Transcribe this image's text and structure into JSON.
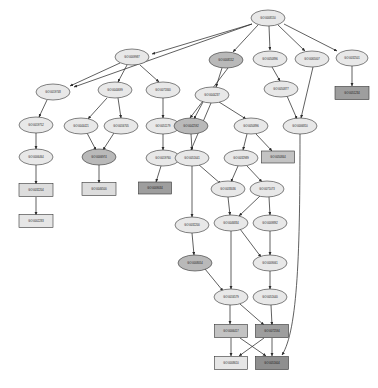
{
  "figure": {
    "type": "gene-ontology-dag",
    "title": "",
    "background": "#ffffff",
    "edge_color": "#2b2b2b",
    "node_border_color": "#333333"
  },
  "fills": {
    "ellipse_light": "#e8e8e8",
    "ellipse_mid": "#d2d2d2",
    "ellipse_dark": "#b9b9b9",
    "box_light": "#dddddd",
    "box_pale": "#e6e6e6",
    "box_mid": "#c3c3c3",
    "box_dark": "#9e9e9e",
    "box_darker": "#8f8f8f"
  },
  "nodes": [
    {
      "id": "n0",
      "label": "GO:0008150",
      "shape": "ellipse",
      "fill": "ellipse_light",
      "x": 268,
      "y": 18,
      "rx": 17,
      "ry": 8
    },
    {
      "id": "n1",
      "label": "GO:0009987",
      "shape": "ellipse",
      "fill": "ellipse_light",
      "x": 132,
      "y": 57,
      "rx": 17,
      "ry": 8
    },
    {
      "id": "n2",
      "label": "GO:0008152",
      "shape": "ellipse",
      "fill": "ellipse_dark",
      "x": 226,
      "y": 60,
      "rx": 17,
      "ry": 8
    },
    {
      "id": "n3",
      "label": "GO:0050896",
      "shape": "ellipse",
      "fill": "ellipse_light",
      "x": 270,
      "y": 59,
      "rx": 17,
      "ry": 8
    },
    {
      "id": "n4",
      "label": "GO:0065007",
      "shape": "ellipse",
      "fill": "ellipse_light",
      "x": 312,
      "y": 59,
      "rx": 17,
      "ry": 8
    },
    {
      "id": "n5",
      "label": "GO:0032501",
      "shape": "ellipse",
      "fill": "ellipse_light",
      "x": 352,
      "y": 58,
      "rx": 16,
      "ry": 8
    },
    {
      "id": "n6",
      "label": "GO:0019748",
      "shape": "ellipse",
      "fill": "ellipse_light",
      "x": 53,
      "y": 92,
      "rx": 17,
      "ry": 8
    },
    {
      "id": "n7",
      "label": "GO:0044699",
      "shape": "ellipse",
      "fill": "ellipse_light",
      "x": 115,
      "y": 90,
      "rx": 17,
      "ry": 8
    },
    {
      "id": "n8",
      "label": "GO:0071840",
      "shape": "ellipse",
      "fill": "ellipse_light",
      "x": 163,
      "y": 90,
      "rx": 17,
      "ry": 8
    },
    {
      "id": "n9",
      "label": "GO:0044237",
      "shape": "ellipse",
      "fill": "ellipse_light",
      "x": 212,
      "y": 95,
      "rx": 17,
      "ry": 8
    },
    {
      "id": "n10",
      "label": "GO:0050877",
      "shape": "ellipse",
      "fill": "ellipse_light",
      "x": 281,
      "y": 89,
      "rx": 17,
      "ry": 8
    },
    {
      "id": "n11",
      "label": "GO:0051234",
      "shape": "box",
      "fill": "box_dark",
      "x": 352,
      "y": 93,
      "w": 34,
      "h": 13
    },
    {
      "id": "n12",
      "label": "GO:0019752",
      "shape": "ellipse",
      "fill": "ellipse_light",
      "x": 36,
      "y": 125,
      "rx": 17,
      "ry": 8
    },
    {
      "id": "n13",
      "label": "GO:0044421",
      "shape": "ellipse",
      "fill": "ellipse_light",
      "x": 81,
      "y": 126,
      "rx": 17,
      "ry": 8
    },
    {
      "id": "n14",
      "label": "GO:0016705",
      "shape": "ellipse",
      "fill": "ellipse_light",
      "x": 121,
      "y": 126,
      "rx": 17,
      "ry": 8
    },
    {
      "id": "n15",
      "label": "GO:0051179",
      "shape": "ellipse",
      "fill": "ellipse_light",
      "x": 163,
      "y": 126,
      "rx": 17,
      "ry": 8
    },
    {
      "id": "n16",
      "label": "GO:0042592",
      "shape": "ellipse",
      "fill": "ellipse_dark",
      "x": 191,
      "y": 126,
      "rx": 17,
      "ry": 8
    },
    {
      "id": "n17",
      "label": "GO:0050896",
      "shape": "ellipse",
      "fill": "ellipse_light",
      "x": 251,
      "y": 126,
      "rx": 17,
      "ry": 8
    },
    {
      "id": "n18",
      "label": "GO:0006810",
      "shape": "ellipse",
      "fill": "ellipse_light",
      "x": 300,
      "y": 126,
      "rx": 17,
      "ry": 8
    },
    {
      "id": "n19",
      "label": "GO:0006464",
      "shape": "ellipse",
      "fill": "ellipse_light",
      "x": 36,
      "y": 157,
      "rx": 17,
      "ry": 8
    },
    {
      "id": "n20",
      "label": "GO:0006974",
      "shape": "ellipse",
      "fill": "ellipse_dark",
      "x": 99,
      "y": 157,
      "rx": 17,
      "ry": 8
    },
    {
      "id": "n21",
      "label": "GO:0019760",
      "shape": "ellipse",
      "fill": "ellipse_light",
      "x": 163,
      "y": 158,
      "rx": 17,
      "ry": 8
    },
    {
      "id": "n22",
      "label": "GO:0051641",
      "shape": "ellipse",
      "fill": "ellipse_light",
      "x": 192,
      "y": 158,
      "rx": 17,
      "ry": 8
    },
    {
      "id": "n23",
      "label": "GO:0032989",
      "shape": "ellipse",
      "fill": "ellipse_light",
      "x": 241,
      "y": 158,
      "rx": 17,
      "ry": 8
    },
    {
      "id": "n24",
      "label": "GO:0050844",
      "shape": "box",
      "fill": "box_mid",
      "x": 278,
      "y": 157,
      "w": 33,
      "h": 12
    },
    {
      "id": "n25",
      "label": "GO:0032204",
      "shape": "box",
      "fill": "box_light",
      "x": 36,
      "y": 190,
      "w": 34,
      "h": 13
    },
    {
      "id": "n26",
      "label": "GO:0046500",
      "shape": "box",
      "fill": "box_light",
      "x": 99,
      "y": 189,
      "w": 34,
      "h": 13
    },
    {
      "id": "n27",
      "label": "GO:0009034",
      "shape": "box",
      "fill": "box_dark",
      "x": 155,
      "y": 188,
      "w": 33,
      "h": 12
    },
    {
      "id": "n28",
      "label": "GO:0033036",
      "shape": "ellipse",
      "fill": "ellipse_light",
      "x": 228,
      "y": 189,
      "rx": 17,
      "ry": 8
    },
    {
      "id": "n29",
      "label": "GO:0071073",
      "shape": "ellipse",
      "fill": "ellipse_light",
      "x": 267,
      "y": 189,
      "rx": 17,
      "ry": 8
    },
    {
      "id": "n30",
      "label": "GO:0002283",
      "shape": "box",
      "fill": "box_pale",
      "x": 36,
      "y": 221,
      "w": 34,
      "h": 13
    },
    {
      "id": "n31",
      "label": "GO:0032200",
      "shape": "ellipse",
      "fill": "ellipse_light",
      "x": 192,
      "y": 225,
      "rx": 17,
      "ry": 8
    },
    {
      "id": "n32",
      "label": "GO:0046834",
      "shape": "ellipse",
      "fill": "ellipse_light",
      "x": 231,
      "y": 223,
      "rx": 17,
      "ry": 8
    },
    {
      "id": "n33",
      "label": "GO:0009892",
      "shape": "ellipse",
      "fill": "ellipse_light",
      "x": 270,
      "y": 223,
      "rx": 17,
      "ry": 8
    },
    {
      "id": "n34",
      "label": "GO:0008054",
      "shape": "ellipse",
      "fill": "ellipse_dark",
      "x": 195,
      "y": 263,
      "rx": 17,
      "ry": 8
    },
    {
      "id": "n35",
      "label": "GO:0009061",
      "shape": "ellipse",
      "fill": "ellipse_light",
      "x": 270,
      "y": 263,
      "rx": 17,
      "ry": 8
    },
    {
      "id": "n36",
      "label": "GO:0016579",
      "shape": "ellipse",
      "fill": "ellipse_light",
      "x": 231,
      "y": 297,
      "rx": 17,
      "ry": 8
    },
    {
      "id": "n37",
      "label": "GO:0051640",
      "shape": "ellipse",
      "fill": "ellipse_light",
      "x": 270,
      "y": 297,
      "rx": 17,
      "ry": 8
    },
    {
      "id": "n38",
      "label": "GO:0006417",
      "shape": "box",
      "fill": "box_mid",
      "x": 231,
      "y": 331,
      "w": 33,
      "h": 13
    },
    {
      "id": "n39",
      "label": "GO:0072594",
      "shape": "box",
      "fill": "box_dark",
      "x": 272,
      "y": 331,
      "w": 33,
      "h": 13
    },
    {
      "id": "n40",
      "label": "GO:0008610",
      "shape": "box",
      "fill": "box_pale",
      "x": 231,
      "y": 363,
      "w": 33,
      "h": 13
    },
    {
      "id": "n41",
      "label": "GO:0051604",
      "shape": "box",
      "fill": "box_darker",
      "x": 272,
      "y": 363,
      "w": 33,
      "h": 13
    }
  ],
  "edges": [
    {
      "from": "n0",
      "to": "n1",
      "path": "M 252 24 L 152 54"
    },
    {
      "from": "n0",
      "to": "n6",
      "path": "M 252 24 L 74 87"
    },
    {
      "from": "n0",
      "to": "n2",
      "path": "M 258 25 L 233 52"
    },
    {
      "from": "n0",
      "to": "n3",
      "path": "M 269 26 L 270 50"
    },
    {
      "from": "n0",
      "to": "n4",
      "path": "M 278 25 L 305 51"
    },
    {
      "from": "n0",
      "to": "n5",
      "path": "M 284 24 L 337 51"
    },
    {
      "from": "n1",
      "to": "n6",
      "path": "M 120 63 L 70 86"
    },
    {
      "from": "n1",
      "to": "n7",
      "path": "M 127 65 L 118 82"
    },
    {
      "from": "n1",
      "to": "n8",
      "path": "M 140 65 L 159 82"
    },
    {
      "from": "n2",
      "to": "n9",
      "path": "M 222 68 L 216 87"
    },
    {
      "from": "n2",
      "to": "n16",
      "path": "M 228 68 L 190 118"
    },
    {
      "from": "n3",
      "to": "n10",
      "path": "M 272 67 L 280 81"
    },
    {
      "from": "n4",
      "to": "n18",
      "path": "M 313 67 L 301 118"
    },
    {
      "from": "n5",
      "to": "n11",
      "path": "M 352 66 L 352 86"
    },
    {
      "from": "n6",
      "to": "n12",
      "path": "M 47 100 L 39 117"
    },
    {
      "from": "n7",
      "to": "n13",
      "path": "M 107 98 L 88 119"
    },
    {
      "from": "n7",
      "to": "n14",
      "path": "M 118 98 L 121 118"
    },
    {
      "from": "n8",
      "to": "n15",
      "path": "M 163 98 L 163 118"
    },
    {
      "from": "n9",
      "to": "n16",
      "path": "M 203 102 L 194 119"
    },
    {
      "from": "n9",
      "to": "n17",
      "path": "M 219 102 L 246 119"
    },
    {
      "from": "n9",
      "to": "n22",
      "path": "M 211 103 L 191 150"
    },
    {
      "from": "n10",
      "to": "n18",
      "path": "M 287 96 L 297 119"
    },
    {
      "from": "n12",
      "to": "n19",
      "path": "M 36 133 L 36 149"
    },
    {
      "from": "n13",
      "to": "n20",
      "path": "M 87 133 L 96 150"
    },
    {
      "from": "n14",
      "to": "n20",
      "path": "M 114 133 L 103 150"
    },
    {
      "from": "n15",
      "to": "n21",
      "path": "M 163 134 L 163 150"
    },
    {
      "from": "n16",
      "to": "n22",
      "path": "M 191 134 L 192 150"
    },
    {
      "from": "n17",
      "to": "n23",
      "path": "M 247 134 L 243 150"
    },
    {
      "from": "n17",
      "to": "n24",
      "path": "M 256 134 L 272 151"
    },
    {
      "from": "n19",
      "to": "n25",
      "path": "M 36 165 L 36 184"
    },
    {
      "from": "n20",
      "to": "n26",
      "path": "M 99 165 L 99 183"
    },
    {
      "from": "n21",
      "to": "n27",
      "path": "M 161 166 L 156 182"
    },
    {
      "from": "n22",
      "to": "n28",
      "path": "M 198 164 L 221 184"
    },
    {
      "from": "n22",
      "to": "n31",
      "path": "M 192 166 L 192 217"
    },
    {
      "from": "n23",
      "to": "n28",
      "path": "M 238 166 L 231 182"
    },
    {
      "from": "n23",
      "to": "n29",
      "path": "M 247 166 L 262 182"
    },
    {
      "from": "n25",
      "to": "n30",
      "path": "M 36 197 L 36 215"
    },
    {
      "from": "n28",
      "to": "n32",
      "path": "M 228 197 L 230 215"
    },
    {
      "from": "n29",
      "to": "n32",
      "path": "M 260 196 L 239 216"
    },
    {
      "from": "n29",
      "to": "n33",
      "path": "M 269 197 L 270 215"
    },
    {
      "from": "n31",
      "to": "n34",
      "path": "M 192 233 L 194 255"
    },
    {
      "from": "n32",
      "to": "n35",
      "path": "M 240 229 L 261 257"
    },
    {
      "from": "n32",
      "to": "n36",
      "path": "M 231 231 L 231 289"
    },
    {
      "from": "n33",
      "to": "n35",
      "path": "M 270 231 L 270 255"
    },
    {
      "from": "n34",
      "to": "n36",
      "path": "M 205 269 L 223 291"
    },
    {
      "from": "n35",
      "to": "n37",
      "path": "M 270 271 L 270 289"
    },
    {
      "from": "n36",
      "to": "n38",
      "path": "M 230 305 L 230 324"
    },
    {
      "from": "n36",
      "to": "n39",
      "path": "M 240 304 L 264 325"
    },
    {
      "from": "n37",
      "to": "n39",
      "path": "M 271 305 L 272 325"
    },
    {
      "from": "n38",
      "to": "n40",
      "path": "M 231 338 L 231 356"
    },
    {
      "from": "n38",
      "to": "n41",
      "path": "M 240 338 L 266 356"
    },
    {
      "from": "n39",
      "to": "n40",
      "path": "M 264 338 L 239 356"
    },
    {
      "from": "n39",
      "to": "n41",
      "path": "M 272 338 L 272 356"
    },
    {
      "from": "n18",
      "to": "n41",
      "path": "M 300 134 C 300 250 298 330 282 355"
    }
  ]
}
